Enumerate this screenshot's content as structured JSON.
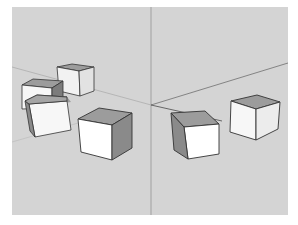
{
  "app": {
    "type": "3d-modeling-viewport",
    "description": "Perspective 3D viewport showing seven cubes on a ground plane with axis lines"
  },
  "viewport": {
    "background": "#d4d4d4",
    "frame_color": "#ffffff",
    "axes": {
      "vertical_line_color": "#8a8a8a",
      "horizon_line_color": "#7a7a7a",
      "origin": [
        139,
        97
      ]
    }
  },
  "colors": {
    "face_front": "#f7f7f7",
    "face_top": "#9c9c9c",
    "face_side": "#8a8a8a",
    "face_side_light": "#e8e8e8",
    "edge": "#333333"
  },
  "objects": [
    {
      "name": "cube-back-center-left",
      "label": "Cube 1"
    },
    {
      "name": "cube-left-upper",
      "label": "Cube 2"
    },
    {
      "name": "cube-left-lower",
      "label": "Cube 3"
    },
    {
      "name": "cube-center",
      "label": "Cube 4"
    },
    {
      "name": "cube-right-front",
      "label": "Cube 5"
    },
    {
      "name": "cube-right-back",
      "label": "Cube 6"
    }
  ]
}
